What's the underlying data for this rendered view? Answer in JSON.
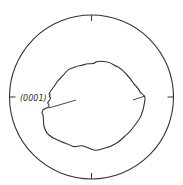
{
  "figure": {
    "type": "stereographic-projection",
    "pole_label": "(0001)",
    "colors": {
      "line": "#333333",
      "background": "#ffffff"
    },
    "outer_circle": {
      "cx": 91.5,
      "cy": 97,
      "r": 82
    },
    "ticks": [
      "top",
      "right",
      "bottom",
      "left"
    ]
  }
}
